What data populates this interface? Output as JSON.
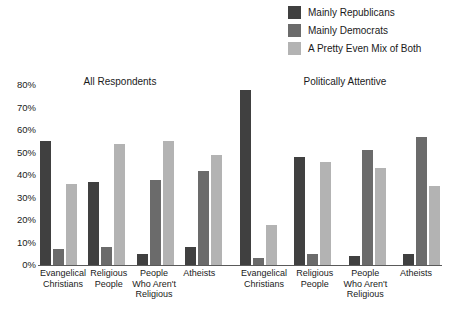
{
  "legend": {
    "items": [
      {
        "label": "Mainly Republicans",
        "color": "#404040",
        "swatch_name": "legend-swatch-mainly-republicans"
      },
      {
        "label": "Mainly Democrats",
        "color": "#6b6b6b",
        "swatch_name": "legend-swatch-mainly-democrats"
      },
      {
        "label": "A Pretty Even Mix of Both",
        "color": "#b3b3b3",
        "swatch_name": "legend-swatch-even-mix"
      }
    ]
  },
  "axis": {
    "yticks": [
      "0%",
      "10%",
      "20%",
      "30%",
      "40%",
      "50%",
      "60%",
      "70%",
      "80%"
    ]
  },
  "chart_data": {
    "type": "bar",
    "title": "",
    "xlabel": "",
    "ylabel": "",
    "ylim": [
      0,
      80
    ],
    "ytick_values": [
      0,
      10,
      20,
      30,
      40,
      50,
      60,
      70,
      80
    ],
    "ytick_labels": [
      "0%",
      "10%",
      "20%",
      "30%",
      "40%",
      "50%",
      "60%",
      "70%",
      "80%"
    ],
    "grid": false,
    "legend_position": "top-right",
    "panels": [
      {
        "title": "All Respondents",
        "categories": [
          "Evangelical\nChristians",
          "Religious\nPeople",
          "People\nWho Aren't\nReligious",
          "Atheists"
        ],
        "series": [
          {
            "name": "Mainly Republicans",
            "color": "#404040",
            "values": [
              55,
              37,
              5,
              8
            ]
          },
          {
            "name": "Mainly Democrats",
            "color": "#6b6b6b",
            "values": [
              7,
              8,
              38,
              42
            ]
          },
          {
            "name": "A Pretty Even Mix of Both",
            "color": "#b3b3b3",
            "values": [
              36,
              54,
              55,
              49
            ]
          }
        ]
      },
      {
        "title": "Politically Attentive",
        "categories": [
          "Evangelical\nChristians",
          "Religious\nPeople",
          "People\nWho Aren't\nReligious",
          "Atheists"
        ],
        "series": [
          {
            "name": "Mainly Republicans",
            "color": "#404040",
            "values": [
              78,
              48,
              4,
              5
            ]
          },
          {
            "name": "Mainly Democrats",
            "color": "#6b6b6b",
            "values": [
              3,
              5,
              51,
              57
            ]
          },
          {
            "name": "A Pretty Even Mix of Both",
            "color": "#b3b3b3",
            "values": [
              18,
              46,
              43,
              35
            ]
          }
        ]
      }
    ]
  }
}
